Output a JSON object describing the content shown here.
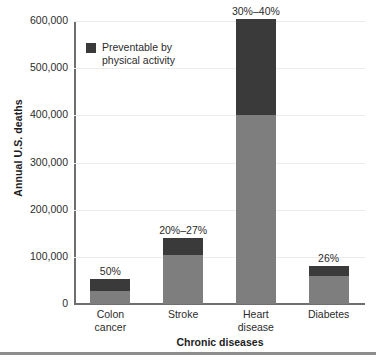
{
  "chart_data": {
    "type": "bar",
    "stacked": true,
    "title": "",
    "xlabel": "Chronic diseases",
    "ylabel": "Annual U.S. deaths",
    "ylim": [
      0,
      600000
    ],
    "ytick_labels": [
      "0",
      "100,000",
      "200,000",
      "300,000",
      "400,000",
      "500,000",
      "600,000"
    ],
    "ytick_values": [
      0,
      100000,
      200000,
      300000,
      400000,
      500000,
      600000
    ],
    "grid": true,
    "legend_position": "inside-top-left",
    "categories": [
      "Colon cancer",
      "Stroke",
      "Heart disease",
      "Diabetes"
    ],
    "category_lines": [
      [
        "Colon",
        "cancer"
      ],
      [
        "Stroke"
      ],
      [
        "Heart",
        "disease"
      ],
      [
        "Diabetes"
      ]
    ],
    "series": [
      {
        "name": "Not preventable by physical activity",
        "color": "#7e7e7e",
        "values": [
          27000,
          103000,
          400000,
          59000
        ]
      },
      {
        "name": "Preventable by physical activity",
        "color": "#3a3a3a",
        "values": [
          25000,
          37000,
          205000,
          21000
        ]
      }
    ],
    "totals": [
      52000,
      140000,
      605000,
      80000
    ],
    "annotations": [
      "50%",
      "20%–27%",
      "30%–40%",
      "26%"
    ]
  },
  "legend": {
    "label_lines": [
      "Preventable",
      "by physical",
      "activity"
    ],
    "swatch_color": "#3a3a3a"
  },
  "axes": {
    "y_title": "Annual U.S. deaths",
    "x_title": "Chronic diseases"
  }
}
